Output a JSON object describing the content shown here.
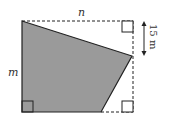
{
  "diagram": {
    "labels": {
      "top": "n",
      "left": "m",
      "measure": "15 m"
    },
    "colors": {
      "shade": "#9a9a9a",
      "line": "#222222"
    },
    "shape": {
      "polygon": [
        [
          22,
          21
        ],
        [
          132,
          56
        ],
        [
          101,
          112
        ],
        [
          22,
          112
        ]
      ],
      "rectangle": {
        "x1": 22,
        "y1": 21,
        "x2": 133,
        "y2": 112
      },
      "right_angle_marks": [
        "top-right",
        "bottom-left",
        "bottom-right"
      ]
    }
  }
}
